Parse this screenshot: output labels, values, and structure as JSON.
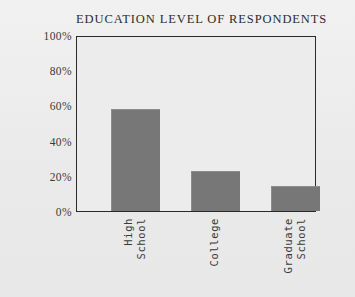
{
  "chart_data": {
    "type": "bar",
    "title": "EDUCATION LEVEL OF RESPONDENTS",
    "xlabel": "",
    "ylabel": "",
    "categories": [
      "High School",
      "College",
      "Graduate School"
    ],
    "category_lines": [
      [
        "High",
        "School"
      ],
      [
        "College"
      ],
      [
        "Graduate",
        "School"
      ]
    ],
    "values": [
      58,
      23,
      14
    ],
    "ylim": [
      0,
      100
    ],
    "ytick_labels": [
      "0%",
      "20%",
      "40%",
      "60%",
      "80%",
      "100%"
    ],
    "ytick_values": [
      0,
      20,
      40,
      60,
      80,
      100
    ],
    "grid": false,
    "legend": false,
    "bar_color": "#777777",
    "axis_color": "#2a2a2a",
    "background_color": "#ededed",
    "plot_background_color": "#ececec",
    "text_color": "#3a3a3a"
  }
}
